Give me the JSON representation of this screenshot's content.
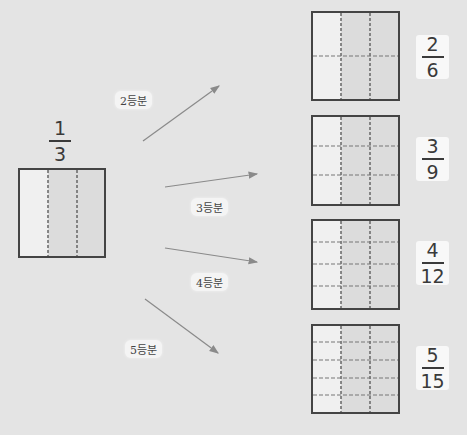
{
  "source": {
    "fraction": {
      "numerator": "1",
      "denominator": "3"
    },
    "columns": 3,
    "rows": 1
  },
  "divisions": [
    {
      "label": "2등분",
      "fraction": {
        "numerator": "2",
        "denominator": "6"
      },
      "columns": 3,
      "rows": 2
    },
    {
      "label": "3등분",
      "fraction": {
        "numerator": "3",
        "denominator": "9"
      },
      "columns": 3,
      "rows": 3
    },
    {
      "label": "4등분",
      "fraction": {
        "numerator": "4",
        "denominator": "12"
      },
      "columns": 3,
      "rows": 4
    },
    {
      "label": "5등분",
      "fraction": {
        "numerator": "5",
        "denominator": "15"
      },
      "columns": 3,
      "rows": 5
    }
  ],
  "colors": {
    "background": "#e4e4e4",
    "square_border": "#444444",
    "square_fill": "#dcdcdc",
    "shaded_column": "#f0f0f0",
    "dashed_line": "#666666",
    "arrow": "#8a8a8a",
    "card": "#f8f8f8"
  }
}
